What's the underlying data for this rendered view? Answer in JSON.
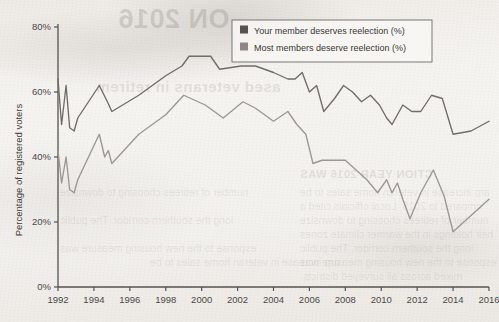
{
  "chart_data": {
    "type": "line",
    "title": "",
    "xlabel": "",
    "ylabel": "Percentage of registered voters",
    "xlim": [
      1992,
      2016
    ],
    "ylim": [
      0,
      80
    ],
    "yticks": [
      "0%",
      "20%",
      "40%",
      "60%",
      "80%"
    ],
    "ytick_values": [
      0,
      20,
      40,
      60,
      80
    ],
    "xticks": [
      "1992",
      "1994",
      "1996",
      "1998",
      "2000",
      "2002",
      "2004",
      "2006",
      "2008",
      "2010",
      "2012",
      "2014",
      "2016"
    ],
    "xtick_values": [
      1992,
      1994,
      1996,
      1998,
      2000,
      2002,
      2004,
      2006,
      2008,
      2010,
      2012,
      2014,
      2016
    ],
    "grid": false,
    "legend_position": "top-right",
    "series": [
      {
        "name": "Your member deserves reelection (%)",
        "color": "#6f6c6a",
        "x": [
          1992.0,
          1992.2,
          1992.45,
          1992.65,
          1992.9,
          1993.1,
          1994.3,
          1994.75,
          1995.0,
          1996.5,
          1998.0,
          1998.9,
          1999.3,
          2000.0,
          2000.5,
          2001.0,
          2002.2,
          2003.0,
          2004.0,
          2004.8,
          2005.2,
          2005.6,
          2006.0,
          2006.4,
          2006.8,
          2007.4,
          2007.9,
          2008.4,
          2008.9,
          2009.4,
          2009.9,
          2010.3,
          2010.6,
          2011.2,
          2011.7,
          2012.2,
          2012.8,
          2013.4,
          2014.0,
          2015.0,
          2016.0
        ],
        "values": [
          64,
          50,
          62,
          49,
          48,
          52,
          62,
          57,
          54,
          59,
          65,
          68,
          71,
          71,
          71,
          67,
          68,
          68,
          66,
          64,
          64,
          66,
          60,
          62,
          54,
          58,
          62,
          60,
          57,
          59,
          56,
          52,
          50,
          56,
          54,
          54,
          59,
          58,
          47,
          48,
          51
        ]
      },
      {
        "name": "Most members deserve reelection (%)",
        "color": "#9a9794",
        "x": [
          1992.0,
          1992.2,
          1992.45,
          1992.65,
          1992.9,
          1993.1,
          1994.3,
          1994.6,
          1994.8,
          1995.0,
          1996.5,
          1998.0,
          1999.0,
          2000.2,
          2001.2,
          2002.3,
          2003.0,
          2004.0,
          2004.8,
          2005.3,
          2005.8,
          2006.2,
          2006.7,
          2007.3,
          2008.0,
          2008.6,
          2009.2,
          2009.8,
          2010.3,
          2010.6,
          2010.9,
          2011.2,
          2011.6,
          2012.2,
          2012.9,
          2013.5,
          2014.0,
          2015.0,
          2016.0
        ],
        "values": [
          42,
          32,
          40,
          30,
          29,
          33,
          47,
          40,
          42,
          38,
          47,
          53,
          59,
          56,
          52,
          57,
          55,
          51,
          54,
          50,
          47,
          38,
          39,
          39,
          39,
          36,
          33,
          29,
          33,
          29,
          32,
          27,
          21,
          29,
          36,
          28,
          17,
          22,
          27
        ]
      }
    ]
  },
  "legend": {
    "items": [
      {
        "label": "Your member deserves reelection (%)",
        "swatch_color": "#55524f"
      },
      {
        "label": "Most members deserve reelection (%)",
        "swatch_color": "#8b8885"
      }
    ]
  },
  "axes": {
    "y_axis_title": "Percentage of registered voters",
    "axis_color": "#55524f"
  },
  "background": {
    "ghost_title": "ON 2016",
    "ghost_sub": "ased veterans in retirem",
    "ghost_head": "CTION YEAR 2016  WAS",
    "ghost_lines": [
      "arp increase in veteran home sales to be",
      "ompared to 2015. Local officials cited a",
      "number of retirees choosing to downsize",
      "heir holdings in the warmer climate zones",
      "long the southern corridor. The public",
      "esponse to the new housing measure was",
      "mixed across all surveyed districts."
    ]
  }
}
